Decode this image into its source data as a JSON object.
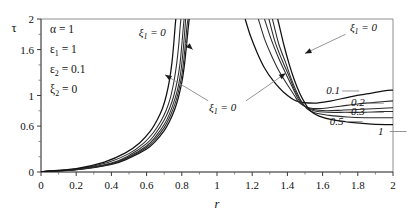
{
  "chart_data": {
    "type": "line",
    "title": "",
    "xlabel": "r",
    "ylabel": "τ",
    "xlim": [
      0,
      2
    ],
    "ylim": [
      0,
      2
    ],
    "grid": false,
    "legend_position": "inside-right",
    "xticks": [
      "0",
      "0.2",
      "0.4",
      "0.6",
      "0.8",
      "1",
      "1.2",
      "1.4",
      "1.6",
      "1.8",
      "2"
    ],
    "xtick_values": [
      0,
      0.2,
      0.4,
      0.6,
      0.8,
      1.0,
      1.2,
      1.4,
      1.6,
      1.8,
      2.0
    ],
    "yticks": [
      "0",
      "0.6",
      "1",
      "1.6",
      "2"
    ],
    "ytick_values": [
      0,
      0.6,
      1.0,
      1.6,
      2.0
    ],
    "parameters": [
      {
        "symbol": "α",
        "sub": "",
        "value": "1"
      },
      {
        "symbol": "ε",
        "sub": "1",
        "value": "1"
      },
      {
        "symbol": "ε",
        "sub": "2",
        "value": "0.1"
      },
      {
        "symbol": "ξ",
        "sub": "2",
        "value": "0"
      }
    ],
    "series": [
      {
        "name": "ξ1 = 0",
        "label": "0",
        "branch_left_points": [
          [
            0.0,
            0.005
          ],
          [
            0.2,
            0.03
          ],
          [
            0.4,
            0.1
          ],
          [
            0.5,
            0.18
          ],
          [
            0.6,
            0.3
          ],
          [
            0.65,
            0.4
          ],
          [
            0.7,
            0.54
          ],
          [
            0.73,
            0.66
          ],
          [
            0.76,
            0.82
          ],
          [
            0.78,
            0.97
          ],
          [
            0.8,
            1.17
          ],
          [
            0.815,
            1.4
          ],
          [
            0.825,
            1.62
          ],
          [
            0.835,
            1.85
          ],
          [
            0.842,
            2.0
          ]
        ],
        "branch_right_points": [
          [
            1.16,
            2.0
          ],
          [
            1.19,
            1.78
          ],
          [
            1.23,
            1.55
          ],
          [
            1.27,
            1.36
          ],
          [
            1.32,
            1.19
          ],
          [
            1.38,
            1.04
          ],
          [
            1.45,
            0.93
          ],
          [
            1.55,
            0.9
          ],
          [
            1.65,
            0.93
          ],
          [
            1.75,
            0.98
          ],
          [
            1.85,
            1.02
          ],
          [
            1.95,
            1.06
          ],
          [
            2.0,
            1.07
          ]
        ]
      },
      {
        "name": "ξ1 = 0.1",
        "label": "0.1",
        "branch_left_points": [
          [
            0.0,
            0.005
          ],
          [
            0.2,
            0.03
          ],
          [
            0.4,
            0.105
          ],
          [
            0.5,
            0.19
          ],
          [
            0.6,
            0.32
          ],
          [
            0.65,
            0.43
          ],
          [
            0.7,
            0.58
          ],
          [
            0.73,
            0.71
          ],
          [
            0.76,
            0.88
          ],
          [
            0.78,
            1.04
          ],
          [
            0.8,
            1.26
          ],
          [
            0.812,
            1.48
          ],
          [
            0.822,
            1.72
          ],
          [
            0.83,
            1.92
          ],
          [
            0.836,
            2.0
          ]
        ],
        "branch_right_points": [
          [
            1.235,
            2.0
          ],
          [
            1.27,
            1.74
          ],
          [
            1.31,
            1.52
          ],
          [
            1.35,
            1.33
          ],
          [
            1.4,
            1.14
          ],
          [
            1.44,
            1.0
          ],
          [
            1.47,
            0.9
          ],
          [
            1.52,
            0.84
          ],
          [
            1.6,
            0.83
          ],
          [
            1.7,
            0.86
          ],
          [
            1.8,
            0.89
          ],
          [
            1.9,
            0.91
          ],
          [
            2.0,
            0.93
          ]
        ]
      },
      {
        "name": "ξ1 = 0.2",
        "label": "0.2",
        "branch_left_points": [
          [
            0.0,
            0.005
          ],
          [
            0.2,
            0.032
          ],
          [
            0.4,
            0.11
          ],
          [
            0.5,
            0.2
          ],
          [
            0.6,
            0.34
          ],
          [
            0.65,
            0.46
          ],
          [
            0.7,
            0.62
          ],
          [
            0.73,
            0.76
          ],
          [
            0.76,
            0.95
          ],
          [
            0.78,
            1.12
          ],
          [
            0.795,
            1.32
          ],
          [
            0.806,
            1.55
          ],
          [
            0.815,
            1.79
          ],
          [
            0.822,
            2.0
          ]
        ],
        "branch_right_points": [
          [
            1.27,
            2.0
          ],
          [
            1.31,
            1.72
          ],
          [
            1.35,
            1.49
          ],
          [
            1.39,
            1.29
          ],
          [
            1.43,
            1.1
          ],
          [
            1.46,
            0.96
          ],
          [
            1.49,
            0.87
          ],
          [
            1.54,
            0.82
          ],
          [
            1.62,
            0.8
          ],
          [
            1.72,
            0.81
          ],
          [
            1.82,
            0.82
          ],
          [
            1.92,
            0.83
          ],
          [
            2.0,
            0.84
          ]
        ]
      },
      {
        "name": "ξ1 = 0.3",
        "label": "0.3",
        "branch_left_points": [
          [
            0.0,
            0.005
          ],
          [
            0.2,
            0.034
          ],
          [
            0.4,
            0.118
          ],
          [
            0.5,
            0.215
          ],
          [
            0.6,
            0.37
          ],
          [
            0.65,
            0.5
          ],
          [
            0.7,
            0.68
          ],
          [
            0.73,
            0.83
          ],
          [
            0.755,
            1.0
          ],
          [
            0.775,
            1.2
          ],
          [
            0.79,
            1.42
          ],
          [
            0.8,
            1.66
          ],
          [
            0.808,
            1.88
          ],
          [
            0.813,
            2.0
          ]
        ],
        "branch_right_points": [
          [
            1.295,
            2.0
          ],
          [
            1.33,
            1.7
          ],
          [
            1.37,
            1.46
          ],
          [
            1.41,
            1.25
          ],
          [
            1.44,
            1.08
          ],
          [
            1.47,
            0.95
          ],
          [
            1.5,
            0.86
          ],
          [
            1.55,
            0.8
          ],
          [
            1.63,
            0.78
          ],
          [
            1.73,
            0.78
          ],
          [
            1.83,
            0.78
          ],
          [
            1.93,
            0.79
          ],
          [
            2.0,
            0.79
          ]
        ]
      },
      {
        "name": "ξ1 = 0.5",
        "label": "0.5",
        "branch_left_points": [
          [
            0.0,
            0.005
          ],
          [
            0.2,
            0.038
          ],
          [
            0.38,
            0.125
          ],
          [
            0.5,
            0.24
          ],
          [
            0.58,
            0.37
          ],
          [
            0.64,
            0.52
          ],
          [
            0.68,
            0.66
          ],
          [
            0.71,
            0.8
          ],
          [
            0.735,
            0.97
          ],
          [
            0.755,
            1.18
          ],
          [
            0.77,
            1.4
          ],
          [
            0.782,
            1.65
          ],
          [
            0.79,
            1.88
          ],
          [
            0.795,
            2.0
          ]
        ],
        "branch_right_points": [
          [
            1.315,
            2.0
          ],
          [
            1.35,
            1.68
          ],
          [
            1.39,
            1.43
          ],
          [
            1.42,
            1.23
          ],
          [
            1.45,
            1.06
          ],
          [
            1.48,
            0.92
          ],
          [
            1.51,
            0.83
          ],
          [
            1.56,
            0.77
          ],
          [
            1.64,
            0.74
          ],
          [
            1.74,
            0.72
          ],
          [
            1.84,
            0.71
          ],
          [
            1.94,
            0.71
          ],
          [
            2.0,
            0.71
          ]
        ]
      },
      {
        "name": "ξ1 = 1",
        "label": "1",
        "branch_left_points": [
          [
            0.0,
            0.005
          ],
          [
            0.2,
            0.045
          ],
          [
            0.36,
            0.13
          ],
          [
            0.48,
            0.25
          ],
          [
            0.56,
            0.38
          ],
          [
            0.62,
            0.53
          ],
          [
            0.66,
            0.68
          ],
          [
            0.69,
            0.83
          ],
          [
            0.712,
            1.0
          ],
          [
            0.73,
            1.2
          ],
          [
            0.744,
            1.43
          ],
          [
            0.754,
            1.67
          ],
          [
            0.762,
            1.9
          ],
          [
            0.766,
            2.0
          ]
        ],
        "branch_right_points": [
          [
            1.345,
            2.0
          ],
          [
            1.38,
            1.66
          ],
          [
            1.41,
            1.41
          ],
          [
            1.44,
            1.2
          ],
          [
            1.47,
            1.03
          ],
          [
            1.5,
            0.9
          ],
          [
            1.53,
            0.8
          ],
          [
            1.58,
            0.73
          ],
          [
            1.66,
            0.68
          ],
          [
            1.76,
            0.65
          ],
          [
            1.86,
            0.63
          ],
          [
            1.96,
            0.62
          ],
          [
            2.0,
            0.62
          ]
        ]
      }
    ],
    "annotations": [
      {
        "id": "top-left-bundle",
        "text": "ξ",
        "sub": "1",
        "eq": "= 0",
        "x_text": 0.64,
        "y_text": 1.78
      },
      {
        "id": "top-right-bundle",
        "text": "ξ",
        "sub": "1",
        "eq": "= 0",
        "x_text": 1.79,
        "y_text": 1.82
      },
      {
        "id": "mid-bundles",
        "text": "ξ",
        "sub": "1",
        "eq": "= 0",
        "x_text": 1.02,
        "y_text": 0.82
      }
    ],
    "curve_labels_right": [
      "0.1",
      "0.2",
      "0.3",
      "0.5",
      "1"
    ]
  }
}
